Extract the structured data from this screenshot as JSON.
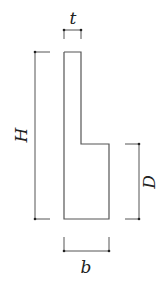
{
  "diagram": {
    "labels": {
      "t": "t",
      "H": "H",
      "D": "D",
      "b": "b"
    },
    "colors": {
      "stroke": "#555555",
      "text": "#222222",
      "background": "#ffffff"
    }
  }
}
